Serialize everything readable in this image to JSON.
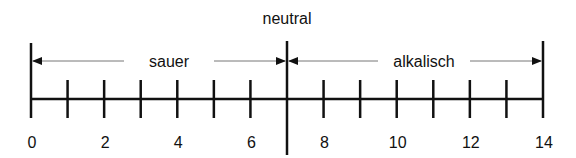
{
  "diagram": {
    "title": "neutral",
    "left_label": "sauer",
    "right_label": "alkalisch",
    "scale": {
      "min": 0,
      "max": 14,
      "neutral": 7
    },
    "tick_labels": [
      "0",
      "2",
      "4",
      "6",
      "8",
      "10",
      "12",
      "14"
    ],
    "tick_label_values": [
      0,
      2,
      4,
      6,
      8,
      10,
      12,
      14
    ],
    "line_color": "#111111",
    "arrow_color": "#777777"
  }
}
